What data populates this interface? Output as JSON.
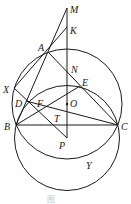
{
  "figure": {
    "title": "",
    "caption": "图",
    "points": {
      "M": "M",
      "K": "K",
      "A": "A",
      "N": "N",
      "E": "E",
      "O": "O",
      "X": "X",
      "D": "D",
      "F": "F",
      "T": "T",
      "B": "B",
      "C": "C",
      "P": "P",
      "Y": "Y"
    },
    "colors": {
      "stroke": "#1a1a1a",
      "background": "#ffffff"
    }
  }
}
